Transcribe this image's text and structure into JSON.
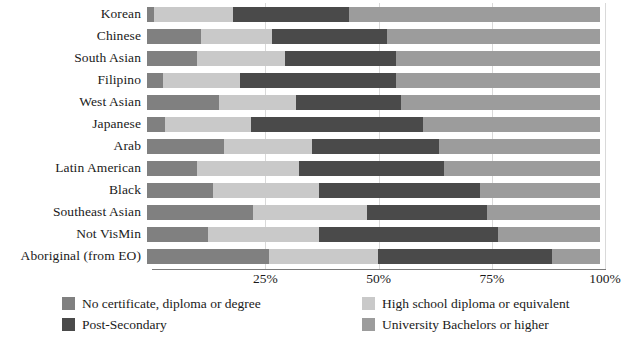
{
  "chart_data": {
    "type": "bar",
    "title": "",
    "subtitle": "",
    "xlabel": "",
    "ylabel": "",
    "orientation": "horizontal",
    "stacked": true,
    "normalized": true,
    "xlim": [
      0,
      100
    ],
    "grid": true,
    "legend_position": "bottom",
    "xticks": [
      "25%",
      "50%",
      "75%",
      "100%"
    ],
    "xtick_values": [
      25,
      50,
      75,
      100
    ],
    "categories": [
      "Korean",
      "Chinese",
      "South Asian",
      "Filipino",
      "West Asian",
      "Japanese",
      "Arab",
      "Latin American",
      "Black",
      "Southeast Asian",
      "Not VisMin",
      "Aboriginal (from EO)"
    ],
    "series": [
      {
        "name": "No certificate, diploma or degree",
        "color": "#808080",
        "values": [
          1.5,
          12.0,
          11.0,
          3.5,
          16.0,
          4.0,
          17.0,
          11.0,
          14.5,
          23.5,
          13.5,
          27.0
        ]
      },
      {
        "name": "High school diploma or equivalent",
        "color": "#c9c9c9",
        "values": [
          17.5,
          15.5,
          19.5,
          17.0,
          17.0,
          19.0,
          19.5,
          22.5,
          23.5,
          25.0,
          24.5,
          24.0
        ]
      },
      {
        "name": "Post-Secondary",
        "color": "#4a4a4a",
        "values": [
          25.5,
          25.5,
          24.5,
          34.5,
          23.0,
          38.0,
          28.0,
          32.0,
          35.5,
          26.5,
          39.5,
          38.5
        ]
      },
      {
        "name": "University Bachelors or higher",
        "color": "#9c9c9c",
        "values": [
          55.5,
          47.0,
          45.0,
          45.0,
          44.0,
          39.0,
          35.5,
          34.5,
          26.5,
          25.0,
          22.5,
          10.5
        ]
      }
    ]
  },
  "legend": {
    "items": [
      {
        "label": "No certificate, diploma or degree",
        "color": "#808080"
      },
      {
        "label": "High school diploma or equivalent",
        "color": "#c9c9c9"
      },
      {
        "label": "Post-Secondary",
        "color": "#4a4a4a"
      },
      {
        "label": "University Bachelors or higher",
        "color": "#9c9c9c"
      }
    ]
  }
}
